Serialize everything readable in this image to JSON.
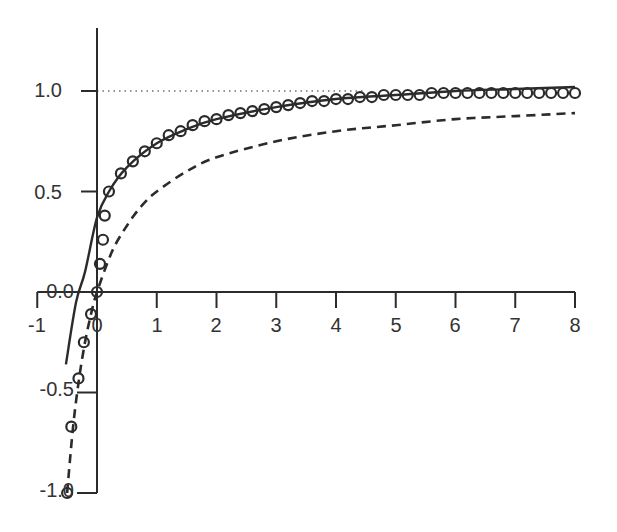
{
  "chart_data": {
    "type": "line",
    "title": "",
    "xlabel": "",
    "ylabel": "",
    "xlim": [
      -1,
      8
    ],
    "ylim": [
      -1.0,
      1.3
    ],
    "grid": false,
    "legend": null,
    "x_ticks": [
      -1,
      0,
      1,
      2,
      3,
      4,
      5,
      6,
      7,
      8
    ],
    "x_tick_labels": [
      "-1",
      "0",
      "1",
      "2",
      "3",
      "4",
      "5",
      "6",
      "7",
      "8"
    ],
    "y_ticks": [
      -1.0,
      -0.5,
      0.0,
      0.5,
      1.0
    ],
    "y_tick_labels": [
      "-1.0",
      "-0.5",
      "0.0",
      "0.5",
      "1.0"
    ],
    "reference_line": {
      "name": "asymptote",
      "y": 1.0,
      "style": "dotted",
      "x_range": [
        0,
        4.5
      ]
    },
    "series": [
      {
        "name": "circles",
        "style": "markers",
        "marker": "open-circle",
        "points": [
          [
            -0.5,
            -1.0
          ],
          [
            -0.43,
            -0.67
          ],
          [
            -0.31,
            -0.43
          ],
          [
            -0.22,
            -0.25
          ],
          [
            -0.1,
            -0.11
          ],
          [
            0.0,
            0.0
          ],
          [
            0.05,
            0.14
          ],
          [
            0.1,
            0.26
          ],
          [
            0.13,
            0.38
          ],
          [
            0.2,
            0.5
          ],
          [
            0.4,
            0.59
          ],
          [
            0.6,
            0.65
          ],
          [
            0.8,
            0.7
          ],
          [
            1.0,
            0.74
          ],
          [
            1.2,
            0.78
          ],
          [
            1.4,
            0.8
          ],
          [
            1.6,
            0.83
          ],
          [
            1.8,
            0.85
          ],
          [
            2.0,
            0.86
          ],
          [
            2.2,
            0.88
          ],
          [
            2.4,
            0.89
          ],
          [
            2.6,
            0.9
          ],
          [
            2.8,
            0.91
          ],
          [
            3.0,
            0.92
          ],
          [
            3.2,
            0.93
          ],
          [
            3.4,
            0.94
          ],
          [
            3.6,
            0.95
          ],
          [
            3.8,
            0.95
          ],
          [
            4.0,
            0.96
          ],
          [
            4.2,
            0.96
          ],
          [
            4.4,
            0.97
          ],
          [
            4.6,
            0.97
          ],
          [
            4.8,
            0.98
          ],
          [
            5.0,
            0.98
          ],
          [
            5.2,
            0.98
          ],
          [
            5.4,
            0.98
          ],
          [
            5.6,
            0.99
          ],
          [
            5.8,
            0.99
          ],
          [
            6.0,
            0.99
          ],
          [
            6.2,
            0.99
          ],
          [
            6.4,
            0.99
          ],
          [
            6.6,
            0.99
          ],
          [
            6.8,
            0.99
          ],
          [
            7.0,
            0.99
          ],
          [
            7.2,
            0.99
          ],
          [
            7.4,
            0.99
          ],
          [
            7.6,
            0.99
          ],
          [
            7.8,
            0.99
          ],
          [
            8.0,
            0.99
          ]
        ]
      },
      {
        "name": "solid",
        "style": "solid",
        "points": [
          [
            -0.52,
            -0.36
          ],
          [
            -0.35,
            -0.05
          ],
          [
            -0.2,
            0.1
          ],
          [
            0.0,
            0.37
          ],
          [
            0.2,
            0.5
          ],
          [
            0.5,
            0.62
          ],
          [
            1.0,
            0.74
          ],
          [
            1.5,
            0.81
          ],
          [
            2.0,
            0.86
          ],
          [
            3.0,
            0.92
          ],
          [
            4.0,
            0.96
          ],
          [
            5.0,
            0.98
          ],
          [
            6.0,
            1.0
          ],
          [
            7.0,
            1.01
          ],
          [
            8.0,
            1.02
          ]
        ]
      },
      {
        "name": "dashed",
        "style": "dashed",
        "points": [
          [
            -0.5,
            -1.0
          ],
          [
            -0.4,
            -0.67
          ],
          [
            -0.3,
            -0.43
          ],
          [
            -0.2,
            -0.25
          ],
          [
            -0.1,
            -0.11
          ],
          [
            0.0,
            0.0
          ],
          [
            0.25,
            0.2
          ],
          [
            0.5,
            0.33
          ],
          [
            0.75,
            0.43
          ],
          [
            1.0,
            0.5
          ],
          [
            1.5,
            0.6
          ],
          [
            2.0,
            0.67
          ],
          [
            3.0,
            0.75
          ],
          [
            4.0,
            0.8
          ],
          [
            5.0,
            0.83
          ],
          [
            6.0,
            0.86
          ],
          [
            7.0,
            0.875
          ],
          [
            8.0,
            0.89
          ]
        ]
      }
    ]
  },
  "layout": {
    "ink_color": "#2b2b2b",
    "x_axis_labels": [
      "-1",
      "0",
      "1",
      "2",
      "3",
      "4",
      "5",
      "6",
      "7",
      "8"
    ],
    "y_axis_labels": [
      "1.0",
      "0.5",
      "0.0",
      "-0.5",
      "-1.0"
    ]
  }
}
